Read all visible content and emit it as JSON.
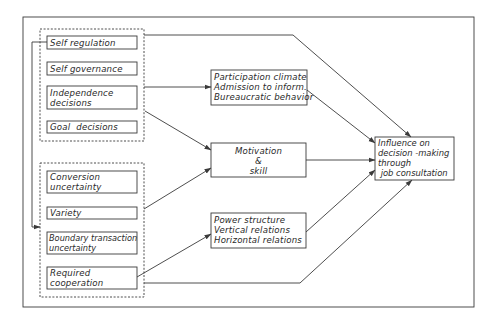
{
  "diagram": {
    "colors": {
      "line": "#3a3a3a",
      "text": "#2a2a2a",
      "background": "#ffffff"
    },
    "group_structure": {
      "items": [
        {
          "label": "Self regulation"
        },
        {
          "label": "Self governance"
        },
        {
          "label": "Independence\ndecisions"
        },
        {
          "label": "Goal  decisions"
        }
      ]
    },
    "group_task": {
      "items": [
        {
          "label": "Conversion\nuncertainty"
        },
        {
          "label": "Variety"
        },
        {
          "label": "Boundary transaction\nuncertainty"
        },
        {
          "label": "Required\ncooperation"
        }
      ]
    },
    "mediators": {
      "participation": {
        "lines": [
          "Participation climate",
          "Admission to inform.",
          "Bureaucratic behavior"
        ]
      },
      "motivation": {
        "lines": [
          "Motivation",
          "&",
          "skill"
        ]
      },
      "power": {
        "lines": [
          "Power structure",
          "Vertical relations",
          "Horizontal relations"
        ]
      }
    },
    "outcome": {
      "lines": [
        "Influence on",
        "decision -making",
        "through",
        " job consultation"
      ]
    },
    "edges": [
      {
        "from": "Self regulation",
        "to": "Task group (dashed)"
      },
      {
        "from": "Structure group (dashed)",
        "to": "Influence on decision-making"
      },
      {
        "from": "Independence decisions",
        "to": "Participation climate"
      },
      {
        "from": "Independence decisions",
        "to": "Motivation & skill"
      },
      {
        "from": "Variety",
        "to": "Motivation & skill"
      },
      {
        "from": "Required cooperation",
        "to": "Power structure"
      },
      {
        "from": "Task group (dashed)",
        "to": "Influence on decision-making"
      },
      {
        "from": "Participation climate",
        "to": "Influence on decision-making"
      },
      {
        "from": "Motivation & skill",
        "to": "Influence on decision-making"
      },
      {
        "from": "Power structure",
        "to": "Influence on decision-making"
      }
    ]
  }
}
